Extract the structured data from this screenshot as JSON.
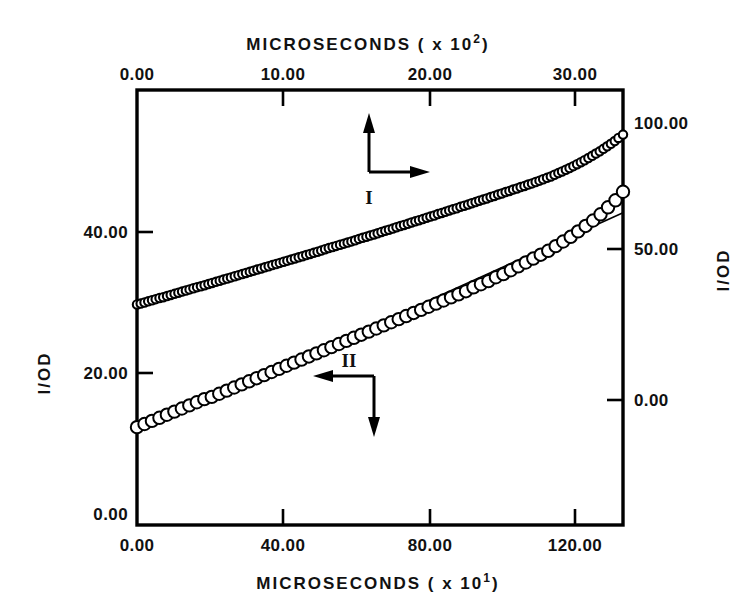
{
  "figure": {
    "background": "#ffffff",
    "ink_color": "#000000",
    "width": 755,
    "height": 612
  },
  "axes": {
    "top": {
      "title": "MICROSECONDS ( x 10",
      "title_exponent": "2",
      "title_suffix": ")",
      "ticks": [
        "0.00",
        "10.00",
        "20.00",
        "30.00"
      ],
      "tick_values": [
        0,
        10,
        20,
        30
      ],
      "range": [
        0,
        33
      ]
    },
    "bottom": {
      "title": "MICROSECONDS ( x 10",
      "title_exponent": "1",
      "title_suffix": ")",
      "ticks": [
        "0.00",
        "40.00",
        "80.00",
        "120.00"
      ],
      "tick_values": [
        0,
        40,
        80,
        120
      ],
      "range": [
        0,
        133
      ]
    },
    "left": {
      "title": "I/OD",
      "ticks": [
        "0.00",
        "20.00",
        "40.00"
      ],
      "tick_values": [
        0,
        20,
        40
      ],
      "range": [
        0,
        56
      ]
    },
    "right": {
      "title": "I/OD",
      "ticks": [
        "0.00",
        "50.00",
        "100.00"
      ],
      "tick_values": [
        0,
        50,
        100
      ],
      "range": [
        -43,
        113
      ]
    }
  },
  "annotations": {
    "series_one": {
      "label": "I",
      "up_arrow": "arrow-up",
      "right_arrow": "arrow-right"
    },
    "series_two": {
      "label": "II",
      "left_arrow": "arrow-left",
      "down_arrow": "arrow-down"
    }
  },
  "chart_data": {
    "type": "scatter",
    "title": "",
    "xlabel": "MICROSECONDS ( x 10^2 )",
    "ylabel": "1/OD",
    "grid": false,
    "legend_position": "inline-annotations",
    "axis_ranges": {
      "top_x": [
        0,
        33
      ],
      "bottom_x": [
        0,
        133
      ],
      "left_y": [
        0,
        56
      ],
      "right_y": [
        -43,
        113
      ]
    },
    "series": [
      {
        "name": "I",
        "marker": "open-circle-small",
        "x_axis": "top",
        "y_axis": "right",
        "x_label": "MICROSECONDS ( x 10^2 )",
        "y_label": "1/OD",
        "n_points": 130,
        "x": [
          0.0,
          0.25,
          0.51,
          0.76,
          1.02,
          1.27,
          1.53,
          1.78,
          2.04,
          2.29,
          2.55,
          2.81,
          3.06,
          3.32,
          3.57,
          3.83,
          4.08,
          4.34,
          4.59,
          4.85,
          5.1,
          5.36,
          5.62,
          5.87,
          6.13,
          6.38,
          6.64,
          6.89,
          7.15,
          7.4,
          7.66,
          7.91,
          8.17,
          8.43,
          8.68,
          8.94,
          9.19,
          9.45,
          9.7,
          9.96,
          10.21,
          10.47,
          10.72,
          10.98,
          11.24,
          11.49,
          11.75,
          12.0,
          12.26,
          12.51,
          12.77,
          13.02,
          13.28,
          13.53,
          13.79,
          14.05,
          14.3,
          14.56,
          14.81,
          15.07,
          15.32,
          15.58,
          15.83,
          16.09,
          16.34,
          16.6,
          16.86,
          17.11,
          17.37,
          17.62,
          17.88,
          18.13,
          18.39,
          18.64,
          18.9,
          19.15,
          19.41,
          19.67,
          19.92,
          20.18,
          20.43,
          20.69,
          20.94,
          21.2,
          21.45,
          21.71,
          21.96,
          22.22,
          22.48,
          22.73,
          22.99,
          23.24,
          23.5,
          23.75,
          24.01,
          24.26,
          24.52,
          24.77,
          25.03,
          25.29,
          25.54,
          25.8,
          26.05,
          26.31,
          26.56,
          26.82,
          27.07,
          27.33,
          27.58,
          27.84,
          28.1,
          28.35,
          28.61,
          28.86,
          29.12,
          29.37,
          29.63,
          29.88,
          30.14,
          30.39,
          30.65,
          30.91,
          31.16,
          31.42,
          31.67,
          31.93,
          32.18,
          32.44,
          32.69,
          33.0
        ],
        "y": [
          36.1,
          36.4,
          36.8,
          37.2,
          37.6,
          38.0,
          38.4,
          38.7,
          39.1,
          39.5,
          39.9,
          40.3,
          40.7,
          41.1,
          41.5,
          41.9,
          42.3,
          42.6,
          43.0,
          43.4,
          43.8,
          44.2,
          44.6,
          45.0,
          45.4,
          45.8,
          46.2,
          46.6,
          47.0,
          47.4,
          47.8,
          48.2,
          48.6,
          49.0,
          49.4,
          49.8,
          50.2,
          50.6,
          51.0,
          51.4,
          51.8,
          52.2,
          52.6,
          53.0,
          53.4,
          53.8,
          54.2,
          54.6,
          55.0,
          55.4,
          55.9,
          56.3,
          56.7,
          57.1,
          57.5,
          57.9,
          58.3,
          58.7,
          59.1,
          59.6,
          60.0,
          60.4,
          60.8,
          61.2,
          61.6,
          62.1,
          62.5,
          62.9,
          63.3,
          63.8,
          64.2,
          64.6,
          65.0,
          65.5,
          65.9,
          66.3,
          66.7,
          67.2,
          67.6,
          68.0,
          68.5,
          68.9,
          69.3,
          69.8,
          70.2,
          70.6,
          71.1,
          71.5,
          71.9,
          72.4,
          72.8,
          73.3,
          73.7,
          74.1,
          74.6,
          75.0,
          75.5,
          75.9,
          76.4,
          76.8,
          77.3,
          77.7,
          78.2,
          78.6,
          79.1,
          79.5,
          80.0,
          80.5,
          81.0,
          81.5,
          82.0,
          82.6,
          83.2,
          83.8,
          84.4,
          85.0,
          85.7,
          86.4,
          87.1,
          87.8,
          88.6,
          89.4,
          90.2,
          91.0,
          91.9,
          92.8,
          93.7,
          94.7,
          95.8,
          97.0
        ]
      },
      {
        "name": "II",
        "marker": "open-circle-large",
        "x_axis": "bottom",
        "y_axis": "left",
        "x_label": "MICROSECONDS ( x 10^1 )",
        "y_label": "1/OD",
        "n_points": 66,
        "x": [
          0.0,
          2.05,
          4.09,
          6.14,
          8.18,
          10.23,
          12.28,
          14.32,
          16.37,
          18.42,
          20.46,
          22.51,
          24.55,
          26.6,
          28.65,
          30.69,
          32.74,
          34.78,
          36.83,
          38.88,
          40.92,
          42.97,
          45.02,
          47.06,
          49.11,
          51.15,
          53.2,
          55.25,
          57.29,
          59.34,
          61.38,
          63.43,
          65.48,
          67.52,
          69.57,
          71.62,
          73.66,
          75.71,
          77.75,
          79.8,
          81.85,
          83.89,
          85.94,
          87.98,
          90.03,
          92.08,
          94.12,
          96.17,
          98.22,
          100.26,
          102.31,
          104.35,
          106.4,
          108.45,
          110.49,
          112.54,
          114.58,
          116.63,
          118.68,
          120.72,
          122.77,
          124.82,
          126.86,
          128.91,
          130.95,
          133.0
        ],
        "y": [
          12.6,
          13.0,
          13.4,
          13.8,
          14.2,
          14.6,
          15.0,
          15.4,
          15.8,
          16.2,
          16.5,
          16.9,
          17.3,
          17.7,
          18.1,
          18.5,
          18.9,
          19.3,
          19.7,
          20.1,
          20.5,
          20.9,
          21.3,
          21.7,
          22.1,
          22.5,
          22.9,
          23.3,
          23.7,
          24.1,
          24.5,
          24.9,
          25.3,
          25.7,
          26.1,
          26.5,
          26.9,
          27.3,
          27.7,
          28.1,
          28.5,
          28.9,
          29.3,
          29.7,
          30.1,
          30.6,
          31.0,
          31.4,
          31.9,
          32.3,
          32.8,
          33.3,
          33.8,
          34.3,
          34.8,
          35.3,
          35.9,
          36.5,
          37.1,
          37.8,
          38.5,
          39.2,
          40.0,
          40.9,
          41.8,
          42.9
        ],
        "fit_line": {
          "type": "linear",
          "x_start": 0.0,
          "x_end": 133.0,
          "y_start": 11.9,
          "y_end": 40.2
        }
      }
    ]
  }
}
